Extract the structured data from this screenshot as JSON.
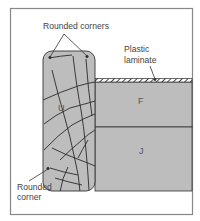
{
  "diagram": {
    "type": "cross-section",
    "labels": {
      "rounded_corners": "Rounded corners",
      "plastic_laminate_line1": "Plastic",
      "plastic_laminate_line2": "laminate",
      "rounded_corner_line1": "Rounded",
      "rounded_corner_line2": "corner"
    },
    "parts": {
      "u": "U",
      "f": "F",
      "j": "J"
    },
    "colors": {
      "border": "#888888",
      "fill": "#bdbdbd",
      "outline": "#333333",
      "grain": "#2a2a2a",
      "text": "#444444",
      "background": "#ffffff"
    }
  }
}
